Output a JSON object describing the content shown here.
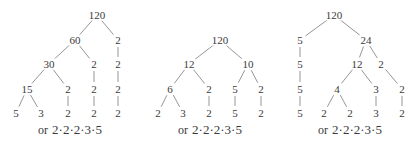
{
  "trees": [
    {
      "root": "120",
      "nodes": [
        {
          "label": "120",
          "x": 97,
          "y": 15
        },
        {
          "label": "60",
          "x": 75,
          "y": 40
        },
        {
          "label": "2",
          "x": 118,
          "y": 40
        },
        {
          "label": "30",
          "x": 49,
          "y": 64
        },
        {
          "label": "2",
          "x": 94,
          "y": 64
        },
        {
          "label": "2",
          "x": 118,
          "y": 64
        },
        {
          "label": "15",
          "x": 27,
          "y": 89
        },
        {
          "label": "2",
          "x": 68,
          "y": 89
        },
        {
          "label": "2",
          "x": 94,
          "y": 89
        },
        {
          "label": "2",
          "x": 118,
          "y": 89
        },
        {
          "label": "5",
          "x": 16,
          "y": 113
        },
        {
          "label": "3",
          "x": 41,
          "y": 113
        },
        {
          "label": "2",
          "x": 68,
          "y": 113
        },
        {
          "label": "2",
          "x": 94,
          "y": 113
        },
        {
          "label": "2",
          "x": 118,
          "y": 113
        }
      ],
      "edges": [
        [
          0,
          1
        ],
        [
          0,
          2
        ],
        [
          1,
          3
        ],
        [
          1,
          4
        ],
        [
          2,
          5
        ],
        [
          3,
          6
        ],
        [
          3,
          7
        ],
        [
          4,
          8
        ],
        [
          5,
          9
        ],
        [
          6,
          10
        ],
        [
          6,
          11
        ],
        [
          7,
          12
        ],
        [
          8,
          13
        ],
        [
          9,
          14
        ]
      ],
      "summary": {
        "or": "or",
        "product": "2·2·2·3·5",
        "x": 70,
        "y": 130
      }
    },
    {
      "root": "120",
      "nodes": [
        {
          "label": "120",
          "x": 220,
          "y": 40
        },
        {
          "label": "12",
          "x": 189,
          "y": 64
        },
        {
          "label": "10",
          "x": 248,
          "y": 64
        },
        {
          "label": "6",
          "x": 170,
          "y": 89
        },
        {
          "label": "2",
          "x": 209,
          "y": 89
        },
        {
          "label": "5",
          "x": 235,
          "y": 89
        },
        {
          "label": "2",
          "x": 261,
          "y": 89
        },
        {
          "label": "2",
          "x": 158,
          "y": 113
        },
        {
          "label": "3",
          "x": 183,
          "y": 113
        },
        {
          "label": "2",
          "x": 209,
          "y": 113
        },
        {
          "label": "5",
          "x": 235,
          "y": 113
        },
        {
          "label": "2",
          "x": 261,
          "y": 113
        }
      ],
      "edges": [
        [
          0,
          1
        ],
        [
          0,
          2
        ],
        [
          1,
          3
        ],
        [
          1,
          4
        ],
        [
          2,
          5
        ],
        [
          2,
          6
        ],
        [
          3,
          7
        ],
        [
          3,
          8
        ],
        [
          4,
          9
        ],
        [
          5,
          10
        ],
        [
          6,
          11
        ]
      ],
      "summary": {
        "or": "or",
        "product": "2·2·2·3·5",
        "x": 210,
        "y": 130
      }
    },
    {
      "root": "120",
      "nodes": [
        {
          "label": "120",
          "x": 334,
          "y": 15
        },
        {
          "label": "5",
          "x": 300,
          "y": 40
        },
        {
          "label": "24",
          "x": 366,
          "y": 40
        },
        {
          "label": "5",
          "x": 300,
          "y": 64
        },
        {
          "label": "12",
          "x": 357,
          "y": 64
        },
        {
          "label": "2",
          "x": 381,
          "y": 64
        },
        {
          "label": "5",
          "x": 300,
          "y": 89
        },
        {
          "label": "4",
          "x": 337,
          "y": 89
        },
        {
          "label": "3",
          "x": 376,
          "y": 89
        },
        {
          "label": "2",
          "x": 402,
          "y": 89
        },
        {
          "label": "5",
          "x": 300,
          "y": 113
        },
        {
          "label": "2",
          "x": 324,
          "y": 113
        },
        {
          "label": "2",
          "x": 350,
          "y": 113
        },
        {
          "label": "3",
          "x": 376,
          "y": 113
        },
        {
          "label": "2",
          "x": 402,
          "y": 113
        }
      ],
      "edges": [
        [
          0,
          1
        ],
        [
          0,
          2
        ],
        [
          1,
          3
        ],
        [
          2,
          4
        ],
        [
          2,
          5
        ],
        [
          3,
          6
        ],
        [
          4,
          7
        ],
        [
          4,
          8
        ],
        [
          5,
          9
        ],
        [
          6,
          10
        ],
        [
          7,
          11
        ],
        [
          7,
          12
        ],
        [
          8,
          13
        ],
        [
          9,
          14
        ]
      ],
      "summary": {
        "or": "or",
        "product": "2·2·2·3·5",
        "x": 350,
        "y": 130
      }
    }
  ],
  "colors": {
    "text": "#3a3a3a",
    "line": "#8a8a8a",
    "background": "#ffffff"
  }
}
